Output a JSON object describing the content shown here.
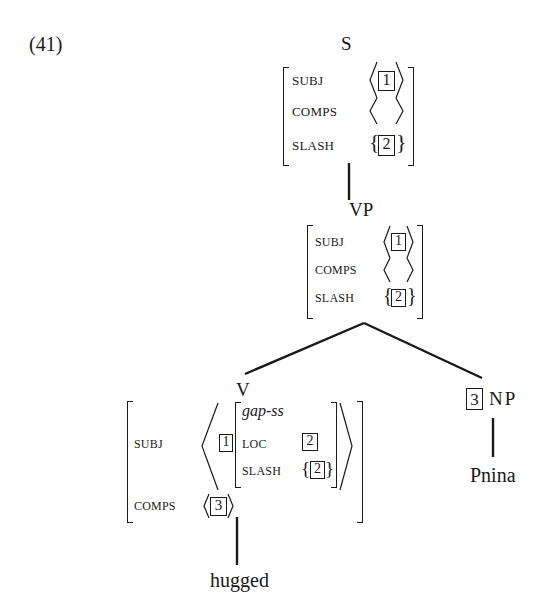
{
  "example_number": "(41)",
  "tree": {
    "root": {
      "label": "S",
      "avm": {
        "subj_feature": "SUBJ",
        "subj_value_tag": "1",
        "comps_feature": "COMPS",
        "slash_feature": "SLASH",
        "slash_value_tag": "2"
      }
    },
    "vp": {
      "label": "VP",
      "avm": {
        "subj_feature": "SUBJ",
        "subj_value_tag": "1",
        "comps_feature": "COMPS",
        "slash_feature": "SLASH",
        "slash_value_tag": "2"
      }
    },
    "verb": {
      "label": "V",
      "avm": {
        "subj_feature": "SUBJ",
        "subj_tag": "1",
        "subj_type": "gap-ss",
        "loc_feature": "LOC",
        "loc_value_tag": "2",
        "inner_slash_feature": "SLASH",
        "inner_slash_value_tag": "2",
        "comps_feature": "COMPS",
        "comps_value_tag": "3"
      },
      "word": "hugged"
    },
    "np": {
      "tag": "3",
      "label": "NP",
      "word": "Pnina"
    }
  },
  "colors": {
    "ink": "#1a1a1a",
    "background": "#ffffff"
  }
}
